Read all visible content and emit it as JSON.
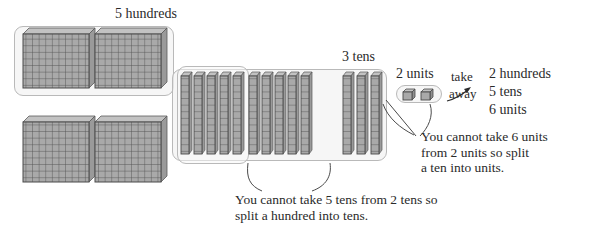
{
  "diagram": {
    "title_labels": {
      "hundreds": "5 hundreds",
      "tens": "3 tens",
      "units": "2 units",
      "take": "take",
      "away": "away"
    },
    "subtrahend": {
      "line1": "2 hundreds",
      "line2": "5 tens",
      "line3": "6 units"
    },
    "captions": {
      "units_note": "You cannot take 6 units\nfrom 2 units so split\na ten into units.",
      "tens_note": "You cannot take 5 tens from 2 tens so\nsplit a hundred into tens."
    },
    "colors": {
      "block_fill": "#a9a9a9",
      "block_line": "#4a4a4a",
      "container_stroke": "#b9b9b9",
      "container_fill": "#f3f3f3",
      "text": "#2a2a2a"
    },
    "blocks": {
      "hundreds_flats_count": 4,
      "hundreds_grouped_count": 2,
      "tens_rods_count": 13,
      "tens_split_group_count": 10,
      "tens_remaining_count": 3,
      "unit_cubes_count": 2
    }
  }
}
